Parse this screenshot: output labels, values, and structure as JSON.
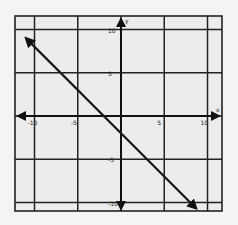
{
  "chart_data": {
    "type": "line",
    "title": "",
    "xlabel": "x",
    "ylabel": "y",
    "xlim": [
      -12,
      12
    ],
    "ylim": [
      -11,
      11
    ],
    "grid": true,
    "grid_minor_step": 1,
    "grid_major_step": 5,
    "x_tick_labels": [
      "-10",
      "-5",
      "5",
      "10"
    ],
    "x_tick_values": [
      -10,
      -5,
      5,
      10
    ],
    "y_tick_labels": [
      "10",
      "5",
      "-5",
      "-10"
    ],
    "y_tick_values": [
      10,
      5,
      -5,
      -10
    ],
    "series": [
      {
        "name": "line",
        "equation": "y = -x - 2",
        "slope": -1,
        "intercept": -2,
        "x": [
          -11,
          8.7
        ],
        "y": [
          9,
          -10.7
        ],
        "arrows": "both",
        "color": "#1a1a1a"
      }
    ],
    "axis_arrows": true
  },
  "colors": {
    "background": "#f4f4f4",
    "grid_minor": "#555555",
    "grid_major": "#222222",
    "axis": "#111111",
    "line": "#1a1a1a"
  }
}
